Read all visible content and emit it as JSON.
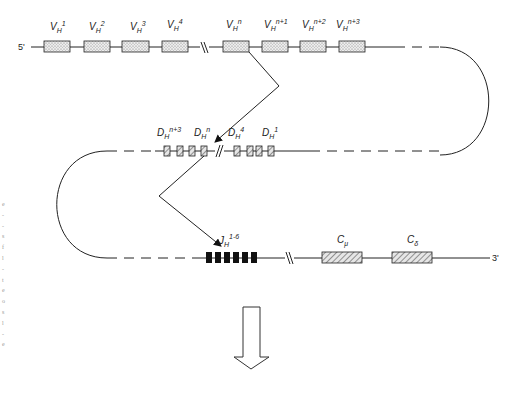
{
  "diagram": {
    "strand_ends": {
      "five_prime": "5'",
      "three_prime": "3'"
    },
    "v_segments": [
      {
        "base": "V",
        "sub": "H",
        "sup": "1"
      },
      {
        "base": "V",
        "sub": "H",
        "sup": "2"
      },
      {
        "base": "V",
        "sub": "H",
        "sup": "3"
      },
      {
        "base": "V",
        "sub": "H",
        "sup": "4"
      },
      {
        "base": "V",
        "sub": "H",
        "sup": "n"
      },
      {
        "base": "V",
        "sub": "H",
        "sup": "n+1"
      },
      {
        "base": "V",
        "sub": "H",
        "sup": "n+2"
      },
      {
        "base": "V",
        "sub": "H",
        "sup": "n+3"
      }
    ],
    "d_segments": [
      {
        "base": "D",
        "sub": "H",
        "sup": "n+3"
      },
      {
        "base": "D",
        "sub": "H",
        "sup": "n"
      },
      {
        "base": "D",
        "sub": "H",
        "sup": "4"
      },
      {
        "base": "D",
        "sub": "H",
        "sup": "1"
      }
    ],
    "j_segment": {
      "base": "J",
      "sub": "H",
      "sup": "1-6"
    },
    "c_segments": [
      {
        "base": "C",
        "sub": "μ"
      },
      {
        "base": "C",
        "sub": "δ"
      }
    ],
    "colors": {
      "line": "#222222",
      "v_fill": "#e2e2e2",
      "d_fill": "#d8d8d8",
      "j_fill": "#111111",
      "c_fill": "#d0d0d0"
    }
  }
}
